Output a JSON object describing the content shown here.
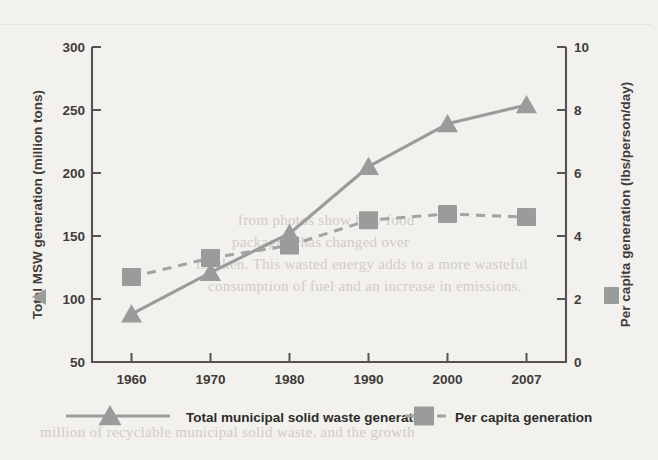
{
  "chart_data": {
    "type": "line",
    "title": "",
    "xlabel": "",
    "categories": [
      "1960",
      "1970",
      "1980",
      "1990",
      "2000",
      "2007"
    ],
    "x_tick_labels": [
      "1960",
      "1970",
      "1980",
      "1990",
      "2000",
      "2007"
    ],
    "grid": false,
    "legend_position": "bottom",
    "axes": {
      "left": {
        "label": "Total MSW generation (million tons)",
        "ticks": [
          "50",
          "100",
          "150",
          "200",
          "250",
          "300"
        ],
        "tick_values": [
          50,
          100,
          150,
          200,
          250,
          300
        ],
        "ylim": [
          50,
          300
        ],
        "marker_icon": "left-triangle-icon"
      },
      "right": {
        "label": "Per capita generation (lbs/person/day)",
        "ticks": [
          "0",
          "2",
          "4",
          "6",
          "8",
          "10"
        ],
        "tick_values": [
          0,
          2,
          4,
          6,
          8,
          10
        ],
        "ylim": [
          0,
          10
        ],
        "marker_icon": "square-icon"
      }
    },
    "series": [
      {
        "name": "Total municipal solid waste generation",
        "axis": "left",
        "marker": "triangle",
        "line_style": "solid",
        "color": "#9a9b9b",
        "values": [
          88,
          121,
          152,
          205,
          239,
          254
        ]
      },
      {
        "name": "Per capita generation",
        "axis": "right",
        "marker": "square",
        "line_style": "dashed",
        "color": "#9a9b9b",
        "values": [
          2.7,
          3.3,
          3.7,
          4.5,
          4.7,
          4.6
        ]
      }
    ],
    "legend": [
      {
        "label": "Total municipal solid waste generation",
        "marker": "triangle",
        "line_style": "solid",
        "color": "#9a9b9b"
      },
      {
        "label": "Per capita generation",
        "marker": "square",
        "line_style": "dashed",
        "color": "#9a9b9b"
      }
    ]
  },
  "background_text": {
    "lines": [
      "from photos show how food",
      "packaging has changed over",
      "is taken. This wasted energy adds to a more wasteful",
      "consumption of fuel and an increase in emissions.",
      "million of recyclable municipal solid waste, and the growth"
    ]
  }
}
